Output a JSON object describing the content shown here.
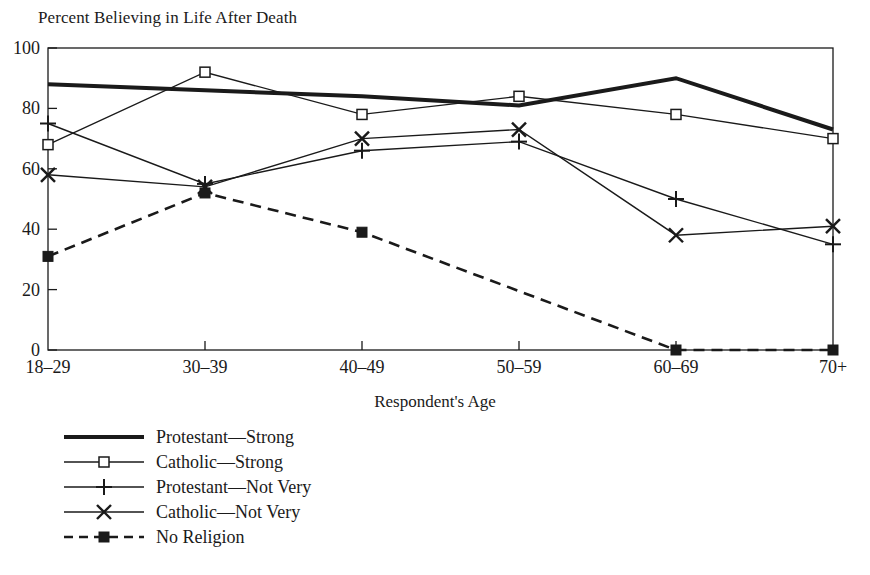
{
  "chart_data": {
    "type": "line",
    "title": "Percent Believing in Life After Death",
    "xlabel": "Respondent's Age",
    "ylabel": "",
    "categories": [
      "18–29",
      "30–39",
      "40–49",
      "50–59",
      "60–69",
      "70+"
    ],
    "ylim": [
      0,
      100
    ],
    "yticks": [
      0,
      20,
      40,
      60,
      80,
      100
    ],
    "ytick_labels": [
      "0",
      "20",
      "40",
      "60",
      "80",
      "100"
    ],
    "grid": false,
    "legend_position": "below-left",
    "series": [
      {
        "name": "Protestant—Strong",
        "values": [
          88,
          86,
          84,
          81,
          90,
          73
        ],
        "line_style": "solid",
        "line_width": 4,
        "marker": "none",
        "color": "#1a1a1a"
      },
      {
        "name": "Catholic—Strong",
        "values": [
          68,
          92,
          78,
          84,
          78,
          70
        ],
        "line_style": "solid",
        "line_width": 1.4,
        "marker": "open-square",
        "color": "#1a1a1a"
      },
      {
        "name": "Protestant—Not Very",
        "values": [
          75,
          55,
          66,
          69,
          50,
          35
        ],
        "line_style": "solid",
        "line_width": 1.4,
        "marker": "plus",
        "color": "#1a1a1a"
      },
      {
        "name": "Catholic—Not Very",
        "values": [
          58,
          54,
          70,
          73,
          38,
          41
        ],
        "line_style": "solid",
        "line_width": 1.4,
        "marker": "cross",
        "color": "#1a1a1a"
      },
      {
        "name": "No Religion",
        "values": [
          31,
          52,
          39,
          null,
          0,
          0
        ],
        "line_style": "dashed",
        "line_width": 2.6,
        "marker": "filled-square",
        "color": "#1a1a1a"
      }
    ]
  },
  "legend": {
    "items": [
      "Protestant—Strong",
      "Catholic—Strong",
      "Protestant—Not Very",
      "Catholic—Not Very",
      "No Religion"
    ]
  }
}
